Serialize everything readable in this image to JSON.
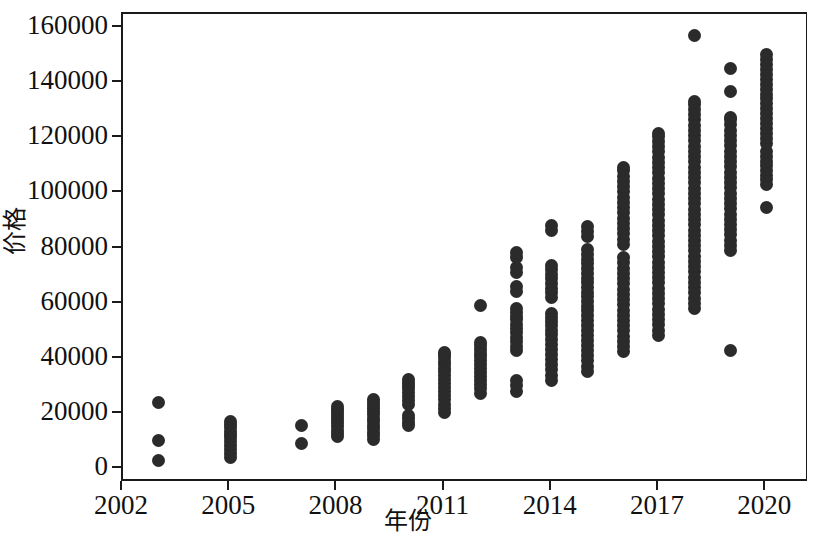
{
  "chart_data": {
    "type": "scatter",
    "title": "",
    "xlabel": "年份",
    "ylabel": "价格",
    "xlim": [
      2002,
      2021.2
    ],
    "ylim": [
      -5000,
      165000
    ],
    "grid": false,
    "legend": null,
    "marker": {
      "shape": "circle",
      "color": "#2b2b2b",
      "size_px": 13
    },
    "xticks": [
      2002,
      2005,
      2008,
      2011,
      2014,
      2017,
      2020
    ],
    "xtick_labels": [
      "2002",
      "2005",
      "2008",
      "2011",
      "2014",
      "2017",
      "2020"
    ],
    "yticks": [
      0,
      20000,
      40000,
      60000,
      80000,
      100000,
      120000,
      140000,
      160000
    ],
    "ytick_labels": [
      "0",
      "20000",
      "40000",
      "60000",
      "80000",
      "100000",
      "120000",
      "140000",
      "160000"
    ],
    "series": [
      {
        "name": "价格",
        "color": "#2b2b2b",
        "points_by_year": [
          {
            "x": 2003,
            "y": [
              3200,
              10300,
              24300
            ]
          },
          {
            "x": 2005,
            "y": [
              4200,
              5600,
              7000,
              8600,
              10200,
              11400,
              12600,
              13800,
              15000,
              16100,
              17200
            ]
          },
          {
            "x": 2007,
            "y": [
              9400,
              15800
            ]
          },
          {
            "x": 2008,
            "y": [
              11900,
              13100,
              14200,
              15300,
              16400,
              17500,
              18600,
              19700,
              20800,
              21800,
              22600
            ]
          },
          {
            "x": 2009,
            "y": [
              10700,
              12100,
              13400,
              14700,
              16000,
              17300,
              18500,
              19700,
              20900,
              22100,
              23200,
              24300,
              25200
            ]
          },
          {
            "x": 2010,
            "y": [
              15900,
              17100,
              18300,
              19400,
              23500,
              25000,
              26400,
              27800,
              29100,
              30300,
              31400,
              32400
            ]
          },
          {
            "x": 2011,
            "y": [
              20400,
              21900,
              23500,
              25100,
              26700,
              28200,
              29700,
              31100,
              32500,
              33900,
              35300,
              36600,
              37900,
              39200,
              40400,
              41500,
              42300
            ]
          },
          {
            "x": 2012,
            "y": [
              27600,
              29100,
              30600,
              32100,
              33600,
              35100,
              36500,
              37900,
              39300,
              40700,
              42100,
              43400,
              44700,
              45900,
              59200
            ]
          },
          {
            "x": 2013,
            "y": [
              28300,
              30300,
              32000,
              43000,
              44600,
              46200,
              47800,
              49400,
              51000,
              52600,
              54100,
              55500,
              56800,
              58100,
              64500,
              66200,
              71300,
              73200,
              76800,
              78400
            ]
          },
          {
            "x": 2014,
            "y": [
              32200,
              34100,
              36000,
              37900,
              39800,
              41700,
              43500,
              45300,
              47000,
              48700,
              50400,
              52000,
              53500,
              55000,
              56300,
              62300,
              63900,
              65600,
              67300,
              69000,
              70700,
              72400,
              74000,
              86500,
              88300
            ]
          },
          {
            "x": 2015,
            "y": [
              35500,
              37400,
              39300,
              41200,
              43100,
              45000,
              46800,
              48600,
              50400,
              52200,
              54000,
              55700,
              57400,
              59100,
              60800,
              62500,
              64200,
              65900,
              67600,
              69300,
              71000,
              72700,
              74400,
              76100,
              77800,
              79500,
              84500,
              86200,
              88000
            ]
          },
          {
            "x": 2016,
            "y": [
              42500,
              44400,
              46300,
              48200,
              50100,
              52000,
              53900,
              55800,
              57700,
              59600,
              61500,
              63400,
              65300,
              67200,
              69100,
              71000,
              72900,
              74800,
              76700,
              81500,
              83400,
              85300,
              87200,
              89100,
              91000,
              92900,
              94800,
              96700,
              98600,
              100500,
              102400,
              104300,
              106200,
              108100,
              109500
            ]
          },
          {
            "x": 2017,
            "y": [
              48500,
              50400,
              52300,
              54200,
              56100,
              58000,
              59900,
              61800,
              63700,
              65600,
              67500,
              69400,
              71300,
              73200,
              75100,
              77000,
              78900,
              80800,
              82700,
              84600,
              86500,
              88400,
              90300,
              92200,
              94100,
              96000,
              97900,
              99800,
              101700,
              103600,
              105500,
              107400,
              109300,
              111200,
              113100,
              115000,
              116900,
              118800,
              120500,
              121800
            ]
          },
          {
            "x": 2018,
            "y": [
              58200,
              60100,
              62000,
              63900,
              65800,
              67700,
              69600,
              71500,
              73400,
              75300,
              77200,
              79100,
              81000,
              82900,
              84800,
              86700,
              88600,
              90500,
              92400,
              94300,
              96200,
              98100,
              100000,
              101900,
              103800,
              105700,
              107600,
              109500,
              111400,
              113300,
              115200,
              117100,
              119000,
              120900,
              122800,
              124700,
              126600,
              128500,
              130400,
              132200,
              133400,
              157300
            ]
          },
          {
            "x": 2019,
            "y": [
              43000,
              79200,
              81100,
              83000,
              84900,
              86800,
              88700,
              90600,
              92500,
              94400,
              96300,
              98200,
              100100,
              102000,
              103900,
              105800,
              107700,
              109600,
              111500,
              113400,
              115300,
              117200,
              119100,
              121000,
              122900,
              124800,
              126600,
              127600,
              136900,
              145100
            ]
          },
          {
            "x": 2020,
            "y": [
              94800,
              103200,
              104900,
              106600,
              108300,
              110000,
              111700,
              113400,
              115100,
              118000,
              119800,
              121600,
              123400,
              125200,
              127000,
              128800,
              130600,
              132400,
              134200,
              136000,
              137800,
              139600,
              141400,
              143200,
              145000,
              146800,
              148500,
              150300
            ]
          }
        ]
      }
    ]
  },
  "axes": {
    "y_title": "价格",
    "x_title": "年份"
  }
}
